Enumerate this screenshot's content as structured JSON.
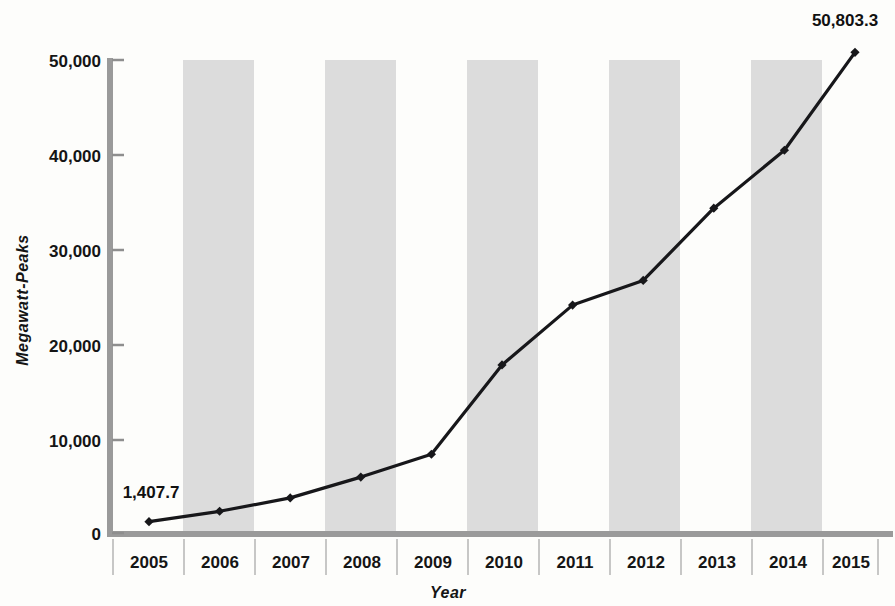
{
  "chart_data": {
    "type": "line",
    "title": "",
    "xlabel": "Year",
    "ylabel": "Megawatt-Peaks",
    "categories": [
      "2005",
      "2006",
      "2007",
      "2008",
      "2009",
      "2010",
      "2011",
      "2012",
      "2013",
      "2014",
      "2015"
    ],
    "values": [
      1407.7,
      2500,
      3900,
      6100,
      8500,
      17900,
      24200,
      26800,
      34400,
      40500,
      50803.3
    ],
    "series": [
      {
        "name": "Cumulative capacity",
        "values": [
          1407.7,
          2500,
          3900,
          6100,
          8500,
          17900,
          24200,
          26800,
          34400,
          40500,
          50803.3
        ]
      }
    ],
    "ylim": [
      0,
      50000
    ],
    "yticks": [
      0,
      10000,
      20000,
      30000,
      40000,
      50000
    ],
    "ytick_labels": [
      "0",
      "10,000",
      "20,000",
      "30,000",
      "40,000",
      "50,000"
    ],
    "xtick_labels": [
      "2005",
      "2006",
      "2007",
      "2008",
      "2009",
      "2010",
      "2011",
      "2012",
      "2013",
      "2014",
      "2015"
    ],
    "grid": false,
    "legend": "none",
    "banded_background": true,
    "banded_categories": [
      "2006",
      "2008",
      "2010",
      "2012",
      "2014"
    ],
    "annotations": [
      {
        "category": "2005",
        "value": 1407.7,
        "text": "1,407.7",
        "position": "above-left"
      },
      {
        "category": "2015",
        "value": 50803.3,
        "text": "50,803.3",
        "position": "above"
      }
    ],
    "colors": {
      "line": "#17171a",
      "marker": "#17171a",
      "band": "#dcdcdc",
      "axis": "#9a9a9a",
      "text": "#151515",
      "background": "#fdfdfb"
    }
  },
  "axes": {
    "y_title": "Megawatt-Peaks",
    "x_title": "Year",
    "y_ticks": [
      {
        "label": "50,000"
      },
      {
        "label": "40,000"
      },
      {
        "label": "30,000"
      },
      {
        "label": "20,000"
      },
      {
        "label": "10,000"
      },
      {
        "label": "0"
      }
    ],
    "x_ticks": [
      {
        "label": "2005"
      },
      {
        "label": "2006"
      },
      {
        "label": "2007"
      },
      {
        "label": "2008"
      },
      {
        "label": "2009"
      },
      {
        "label": "2010"
      },
      {
        "label": "2011"
      },
      {
        "label": "2012"
      },
      {
        "label": "2013"
      },
      {
        "label": "2014"
      },
      {
        "label": "2015"
      }
    ]
  },
  "labels": {
    "first_point": "1,407.7",
    "last_point": "50,803.3"
  }
}
